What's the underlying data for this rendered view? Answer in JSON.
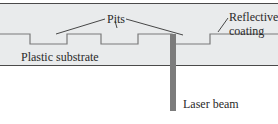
{
  "diagram": {
    "labels": {
      "pits": "Pits",
      "reflective_coating_line1": "Reflective",
      "reflective_coating_line2": "coating",
      "plastic_substrate": "Plastic substrate",
      "laser_beam": "Laser beam"
    },
    "colors": {
      "disc_fill": "#e9ebec",
      "border": "#4a4a4a",
      "profile": "#7a7a7a",
      "laser": "#7c7c7c",
      "leader": "#333333"
    }
  }
}
